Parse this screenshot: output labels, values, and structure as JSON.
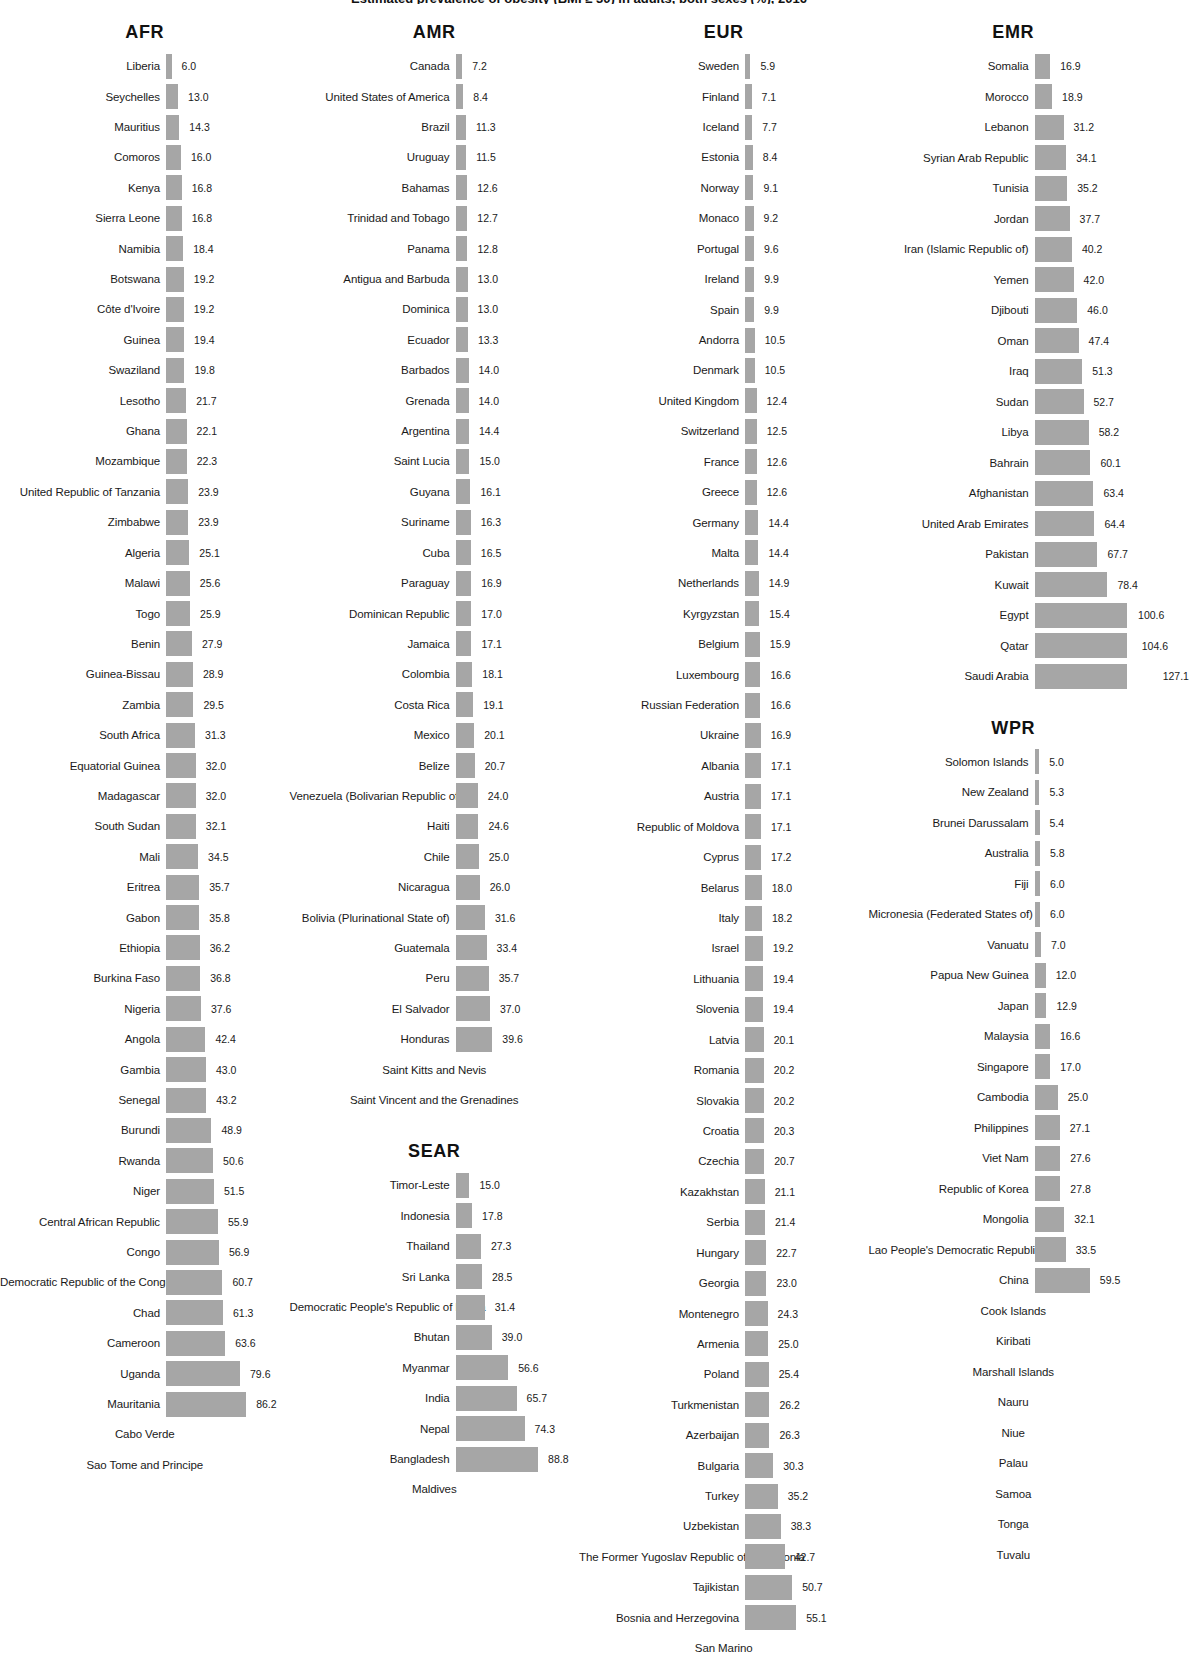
{
  "title": "Estimated prevalence of obesity (BMI ≥ 30) in adults, both sexes (%), 2016",
  "chart_data": {
    "type": "bar",
    "title": "Estimated prevalence of obesity (BMI ≥ 30) in adults, both sexes (%), 2016",
    "xlabel": "",
    "ylabel": "",
    "grid": false,
    "legend": "none",
    "bar_color": "#a6a6a6",
    "value_format": "one-decimal",
    "groups": [
      {
        "name": "AFR",
        "categories": [
          "Liberia",
          "Seychelles",
          "Mauritius",
          "Comoros",
          "Kenya",
          "Sierra Leone",
          "Namibia",
          "Botswana",
          "Côte d'Ivoire",
          "Guinea",
          "Swaziland",
          "Lesotho",
          "Ghana",
          "Mozambique",
          "United Republic of Tanzania",
          "Zimbabwe",
          "Algeria",
          "Malawi",
          "Togo",
          "Benin",
          "Guinea-Bissau",
          "Zambia",
          "South Africa",
          "Equatorial Guinea",
          "Madagascar",
          "South Sudan",
          "Mali",
          "Eritrea",
          "Gabon",
          "Ethiopia",
          "Burkina Faso",
          "Nigeria",
          "Angola",
          "Gambia",
          "Senegal",
          "Burundi",
          "Rwanda",
          "Niger",
          "Central African Republic",
          "Congo",
          "Democratic Republic of the Congo",
          "Chad",
          "Cameroon",
          "Uganda",
          "Mauritania",
          "Cabo Verde",
          "Sao Tome and Principe"
        ],
        "values": [
          6.0,
          13.0,
          14.3,
          16.0,
          16.8,
          16.8,
          18.4,
          19.2,
          19.2,
          19.4,
          19.8,
          21.7,
          22.1,
          22.3,
          23.9,
          23.9,
          25.1,
          25.6,
          25.9,
          27.9,
          28.9,
          29.5,
          31.3,
          32.0,
          32.0,
          32.1,
          34.5,
          35.7,
          35.8,
          36.2,
          36.8,
          37.6,
          42.4,
          43.0,
          43.2,
          48.9,
          50.6,
          51.5,
          55.9,
          56.9,
          60.7,
          61.3,
          63.6,
          79.6,
          86.2,
          null,
          null
        ]
      },
      {
        "name": "AMR",
        "categories": [
          "Canada",
          "United States of America",
          "Brazil",
          "Uruguay",
          "Bahamas",
          "Trinidad and Tobago",
          "Panama",
          "Antigua and Barbuda",
          "Dominica",
          "Ecuador",
          "Barbados",
          "Grenada",
          "Argentina",
          "Saint Lucia",
          "Guyana",
          "Suriname",
          "Cuba",
          "Paraguay",
          "Dominican Republic",
          "Jamaica",
          "Colombia",
          "Costa Rica",
          "Mexico",
          "Belize",
          "Venezuela (Bolivarian Republic of)",
          "Haiti",
          "Chile",
          "Nicaragua",
          "Bolivia (Plurinational State of)",
          "Guatemala",
          "Peru",
          "El Salvador",
          "Honduras",
          "Saint Kitts and Nevis",
          "Saint Vincent and the Grenadines"
        ],
        "values": [
          7.2,
          8.4,
          11.3,
          11.5,
          12.6,
          12.7,
          12.8,
          13.0,
          13.0,
          13.3,
          14.0,
          14.0,
          14.4,
          15.0,
          16.1,
          16.3,
          16.5,
          16.9,
          17.0,
          17.1,
          18.1,
          19.1,
          20.1,
          20.7,
          24.0,
          24.6,
          25.0,
          26.0,
          31.6,
          33.4,
          35.7,
          37.0,
          39.6,
          null,
          null
        ]
      },
      {
        "name": "SEAR",
        "categories": [
          "Timor-Leste",
          "Indonesia",
          "Thailand",
          "Sri Lanka",
          "Democratic People's Republic of Korea",
          "Bhutan",
          "Myanmar",
          "India",
          "Nepal",
          "Bangladesh",
          "Maldives"
        ],
        "values": [
          15.0,
          17.8,
          27.3,
          28.5,
          31.4,
          39.0,
          56.6,
          65.7,
          74.3,
          88.8,
          null
        ]
      },
      {
        "name": "EUR",
        "categories": [
          "Sweden",
          "Finland",
          "Iceland",
          "Estonia",
          "Norway",
          "Monaco",
          "Portugal",
          "Ireland",
          "Spain",
          "Andorra",
          "Denmark",
          "United Kingdom",
          "Switzerland",
          "France",
          "Greece",
          "Germany",
          "Malta",
          "Netherlands",
          "Kyrgyzstan",
          "Belgium",
          "Luxembourg",
          "Russian Federation",
          "Ukraine",
          "Albania",
          "Austria",
          "Republic of Moldova",
          "Cyprus",
          "Belarus",
          "Italy",
          "Israel",
          "Lithuania",
          "Slovenia",
          "Latvia",
          "Romania",
          "Slovakia",
          "Croatia",
          "Czechia",
          "Kazakhstan",
          "Serbia",
          "Hungary",
          "Georgia",
          "Montenegro",
          "Armenia",
          "Poland",
          "Turkmenistan",
          "Azerbaijan",
          "Bulgaria",
          "Turkey",
          "Uzbekistan",
          "The Former Yugoslav Republic of Macedonia",
          "Tajikistan",
          "Bosnia and Herzegovina",
          "San Marino"
        ],
        "values": [
          5.9,
          7.1,
          7.7,
          8.4,
          9.1,
          9.2,
          9.6,
          9.9,
          9.9,
          10.5,
          10.5,
          12.4,
          12.5,
          12.6,
          12.6,
          14.4,
          14.4,
          14.9,
          15.4,
          15.9,
          16.6,
          16.6,
          16.9,
          17.1,
          17.1,
          17.1,
          17.2,
          18.0,
          18.2,
          19.2,
          19.4,
          19.4,
          20.1,
          20.2,
          20.2,
          20.3,
          20.7,
          21.1,
          21.4,
          22.7,
          23.0,
          24.3,
          25.0,
          25.4,
          26.2,
          26.3,
          30.3,
          35.2,
          38.3,
          42.7,
          50.7,
          55.1,
          null
        ]
      },
      {
        "name": "EMR",
        "categories": [
          "Somalia",
          "Morocco",
          "Lebanon",
          "Syrian Arab Republic",
          "Tunisia",
          "Jordan",
          "Iran (Islamic Republic of)",
          "Yemen",
          "Djibouti",
          "Oman",
          "Iraq",
          "Sudan",
          "Libya",
          "Bahrain",
          "Afghanistan",
          "United Arab Emirates",
          "Pakistan",
          "Kuwait",
          "Egypt",
          "Qatar",
          "Saudi Arabia"
        ],
        "values": [
          16.9,
          18.9,
          31.2,
          34.1,
          35.2,
          37.7,
          40.2,
          42.0,
          46.0,
          47.4,
          51.3,
          52.7,
          58.2,
          60.1,
          63.4,
          64.4,
          67.7,
          78.4,
          100.6,
          104.6,
          127.1
        ]
      },
      {
        "name": "WPR",
        "categories": [
          "Solomon Islands",
          "New Zealand",
          "Brunei Darussalam",
          "Australia",
          "Fiji",
          "Micronesia (Federated States of)",
          "Vanuatu",
          "Papua New Guinea",
          "Japan",
          "Malaysia",
          "Singapore",
          "Cambodia",
          "Philippines",
          "Viet Nam",
          "Republic of Korea",
          "Mongolia",
          "Lao People's Democratic Republic",
          "China",
          "Cook Islands",
          "Kiribati",
          "Marshall Islands",
          "Nauru",
          "Niue",
          "Palau",
          "Samoa",
          "Tonga",
          "Tuvalu"
        ],
        "values": [
          5.0,
          5.3,
          5.4,
          5.8,
          6.0,
          6.0,
          7.0,
          12.0,
          12.9,
          16.6,
          17.0,
          25.0,
          27.1,
          27.6,
          27.8,
          32.1,
          33.5,
          59.5,
          null,
          null,
          null,
          null,
          null,
          null,
          null,
          null,
          null
        ]
      }
    ]
  }
}
